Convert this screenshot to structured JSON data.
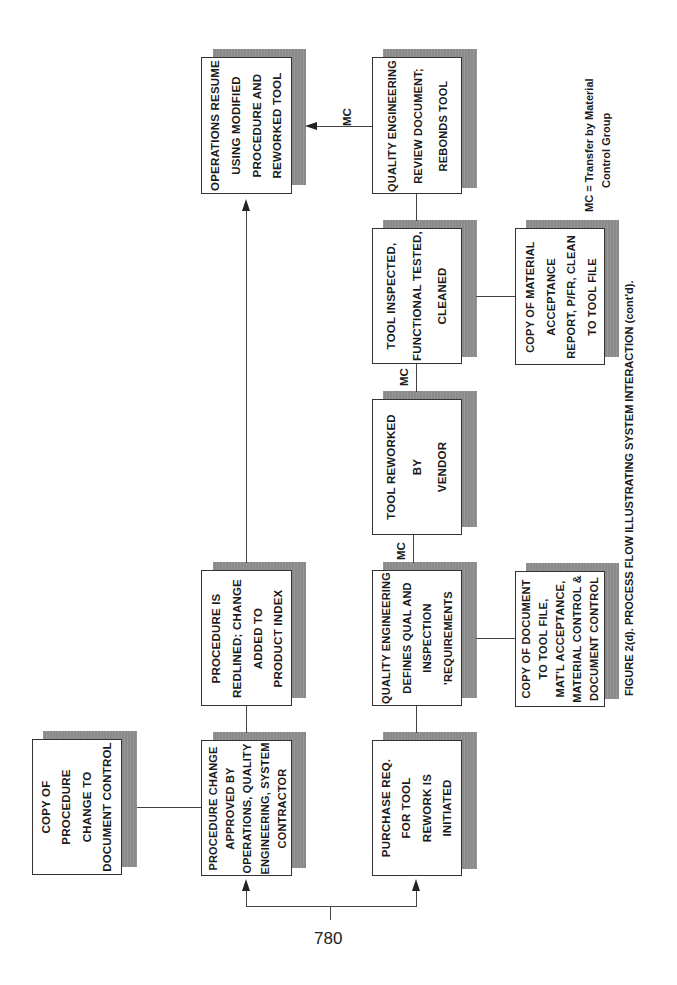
{
  "figure": {
    "caption": "FIGURE 2(d). PROCESS FLOW ILLUSTRATING SYSTEM INTERACTION (cont'd).",
    "page_number": "780",
    "legend": {
      "line1": "MC = Transfer by Material",
      "line2": "Control Group"
    }
  },
  "boxes": {
    "copy_procedure": {
      "lines": [
        "COPY OF",
        "PROCEDURE",
        "CHANGE TO",
        "DOCUMENT CONTROL"
      ]
    },
    "procedure_change_approved": {
      "lines": [
        "PROCEDURE CHANGE",
        "APPROVED BY",
        "OPERATIONS, QUALITY",
        "ENGINEERING, SYSTEM",
        "CONTRACTOR"
      ]
    },
    "procedure_redlined": {
      "lines": [
        "PROCEDURE IS",
        "REDLINED; CHANGE",
        "ADDED TO",
        "PRODUCT INDEX"
      ]
    },
    "operations_resume": {
      "lines": [
        "OPERATIONS RESUME",
        "USING MODIFIED",
        "PROCEDURE AND",
        "REWORKED TOOL"
      ]
    },
    "purchase_req": {
      "lines": [
        "PURCHASE REQ.",
        "FOR TOOL",
        "REWORK IS",
        "INITIATED"
      ]
    },
    "qe_defines": {
      "lines": [
        "QUALITY ENGINEERING",
        "DEFINES QUAL AND",
        "INSPECTION",
        "'REQUIREMENTS"
      ]
    },
    "tool_reworked": {
      "lines": [
        "TOOL REWORKED",
        "BY",
        "VENDOR"
      ]
    },
    "tool_inspected": {
      "lines": [
        "TOOL INSPECTED,",
        "FUNCTIONAL TESTED,",
        "CLEANED"
      ]
    },
    "qe_review": {
      "lines": [
        "QUALITY ENGINEERING",
        "REVIEW DOCUMENT;",
        "REBONDS TOOL"
      ]
    },
    "copy_document": {
      "lines": [
        "COPY OF DOCUMENT",
        "TO TOOL FILE,",
        "MAT'L ACCEPTANCE,",
        "MATERIAL CONTROL &",
        "DOCUMENT CONTROL"
      ]
    },
    "copy_material_acceptance": {
      "lines": [
        "COPY OF MATERIAL",
        "ACCEPTANCE",
        "REPORT, P/FR, CLEAN",
        "TO TOOL FILE"
      ]
    }
  },
  "connector_labels": {
    "mc_1": "MC",
    "mc_2": "MC",
    "mc_3": "MC"
  }
}
